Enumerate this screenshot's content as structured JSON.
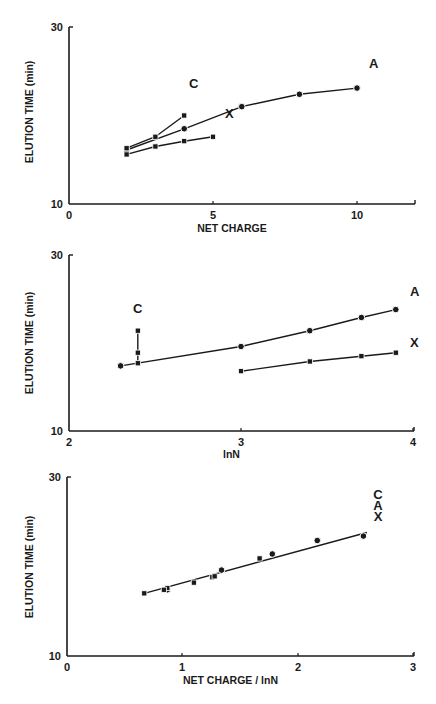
{
  "chart_data": [
    {
      "type": "line",
      "title": "",
      "xlabel": "NET CHARGE",
      "ylabel": "ELUTION TIME (min)",
      "xlim": [
        0,
        12
      ],
      "ylim": [
        10,
        30
      ],
      "x_ticks": [
        "0",
        "5",
        "10"
      ],
      "y_ticks": [
        "10",
        "30"
      ],
      "grid": false,
      "legend": "inline labels at line ends",
      "series": [
        {
          "name": "A",
          "marker": "circle",
          "x": [
            2,
            4,
            6,
            8,
            10
          ],
          "y": [
            16.1,
            18.5,
            21.0,
            22.4,
            23.1
          ]
        },
        {
          "name": "C",
          "marker": "square",
          "x": [
            2,
            3,
            4
          ],
          "y": [
            16.3,
            17.6,
            20.0
          ]
        },
        {
          "name": "X",
          "marker": "square",
          "x": [
            2,
            3,
            4,
            5
          ],
          "y": [
            15.6,
            16.5,
            17.1,
            17.6
          ]
        }
      ]
    },
    {
      "type": "line",
      "title": "",
      "xlabel": "lnN",
      "ylabel": "ELUTION TIME (min)",
      "xlim": [
        2,
        4
      ],
      "ylim": [
        10,
        30
      ],
      "x_ticks": [
        "2",
        "3",
        "4"
      ],
      "y_ticks": [
        "10",
        "30"
      ],
      "grid": false,
      "legend": "inline labels at line ends",
      "series": [
        {
          "name": "A",
          "marker": "circle",
          "x": [
            2.3,
            3.0,
            3.4,
            3.7,
            3.9
          ],
          "y": [
            17.4,
            19.6,
            21.4,
            22.9,
            23.8
          ]
        },
        {
          "name": "C",
          "marker": "square",
          "x": [
            2.4,
            2.4,
            2.4
          ],
          "y": [
            17.7,
            18.9,
            21.4
          ]
        },
        {
          "name": "X",
          "marker": "square",
          "x": [
            3.0,
            3.4,
            3.7,
            3.9
          ],
          "y": [
            16.8,
            17.9,
            18.5,
            18.9
          ]
        }
      ]
    },
    {
      "type": "scatter",
      "title": "",
      "xlabel": "NET CHARGE / lnN",
      "ylabel": "ELUTION TIME (min)",
      "xlim": [
        0,
        3
      ],
      "ylim": [
        10,
        30
      ],
      "x_ticks": [
        "0",
        "1",
        "2",
        "3"
      ],
      "y_ticks": [
        "10",
        "30"
      ],
      "grid": false,
      "legend": "stacked labels C, A, X at right end of fit line",
      "fit_line": {
        "x": [
          0.67,
          2.6
        ],
        "y": [
          17.0,
          23.8
        ]
      },
      "series": [
        {
          "name": "A",
          "marker": "circle",
          "x": [
            0.87,
            1.34,
            1.78,
            2.17,
            2.57
          ],
          "y": [
            17.4,
            19.6,
            21.4,
            22.9,
            23.4
          ]
        },
        {
          "name": "C",
          "marker": "square",
          "x": [
            0.87,
            1.26,
            1.67
          ],
          "y": [
            17.6,
            18.8,
            20.9
          ]
        },
        {
          "name": "X",
          "marker": "square",
          "x": [
            0.67,
            0.84,
            1.1,
            1.28
          ],
          "y": [
            17.0,
            17.4,
            18.2,
            18.9
          ]
        }
      ]
    }
  ],
  "labels": {
    "y_axis": "ELUTION TIME (min)",
    "series_A": "A",
    "series_C": "C",
    "series_X": "X"
  }
}
